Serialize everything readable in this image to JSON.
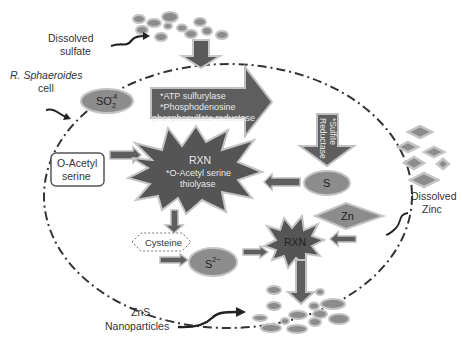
{
  "colors": {
    "dark_fill": "#5a5a5a",
    "mid_fill": "#7a7a7a",
    "light_outline": "#b8b8b8",
    "ellipse_fill": "#8c8c8c",
    "ellipse_outline": "#c4c4c4",
    "text": "#333333",
    "membrane": "#333333"
  },
  "labels": {
    "dissolved_sulfate": [
      "Dissolved",
      "sulfate"
    ],
    "cell": [
      "R. Sphaeroides",
      "cell"
    ],
    "dissolved_zinc": [
      "Dissolved",
      "Zinc"
    ],
    "zns": [
      "ZnS",
      "Nanoparticles"
    ]
  },
  "nodes": {
    "sulfate_ion": {
      "base": "SO",
      "sub": "2",
      "sup": "-4"
    },
    "enzymes_arrow": [
      "*ATP sulfurylase",
      "*Phosphodenosine",
      "phosphosulfate reductase"
    ],
    "sulfite_reductase": [
      "*Sulfite",
      "Reductase"
    ],
    "sulfur": "S",
    "o_acetyl_serine": [
      "O-Acetyl",
      "serine"
    ],
    "rxn1": {
      "title": "RXN",
      "lines": [
        "*O-Acetyl serine",
        "thiolyase"
      ]
    },
    "cysteine": "Cysteine",
    "sulfide": {
      "base": "S",
      "sup": "2−"
    },
    "rxn2": "RXN",
    "zinc": "Zn"
  }
}
